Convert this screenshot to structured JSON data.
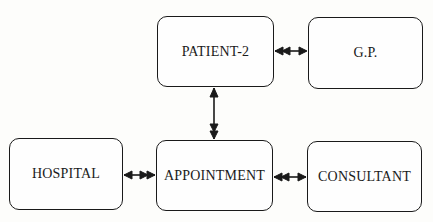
{
  "diagram": {
    "nodes": [
      {
        "id": "patient-2",
        "label": "PATIENT-2",
        "x": 157,
        "y": 16,
        "w": 117,
        "h": 71
      },
      {
        "id": "gp",
        "label": "G.P.",
        "x": 308,
        "y": 17,
        "w": 115,
        "h": 72
      },
      {
        "id": "hospital",
        "label": "HOSPITAL",
        "x": 9,
        "y": 138,
        "w": 114,
        "h": 72
      },
      {
        "id": "appointment",
        "label": "APPOINTMENT",
        "x": 156,
        "y": 140,
        "w": 117,
        "h": 71
      },
      {
        "id": "consultant",
        "label": "CONSULTANT",
        "x": 307,
        "y": 141,
        "w": 115,
        "h": 71
      }
    ],
    "edges": [
      {
        "from": "patient-2",
        "to": "gp",
        "from_heads": 2,
        "to_heads": 1
      },
      {
        "from": "hospital",
        "to": "appointment",
        "from_heads": 1,
        "to_heads": 2
      },
      {
        "from": "appointment",
        "to": "consultant",
        "from_heads": 2,
        "to_heads": 1
      },
      {
        "from": "patient-2",
        "to": "appointment",
        "from_heads": 1,
        "to_heads": 2
      }
    ],
    "colors": {
      "stroke": "#1a1a1a",
      "background": "#fdfdfb"
    }
  }
}
